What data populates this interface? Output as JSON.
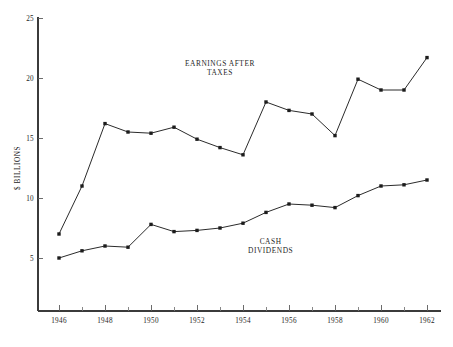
{
  "chart_data": {
    "type": "line",
    "title": "",
    "xlabel": "",
    "ylabel": "$ BILLIONS",
    "xlim": [
      1945.4,
      1962.6
    ],
    "ylim": [
      0,
      25
    ],
    "ytick_values": [
      5,
      10,
      15,
      20,
      25
    ],
    "ytick_labels": [
      "5",
      "10",
      "15",
      "20",
      "25"
    ],
    "x": [
      1946,
      1947,
      1948,
      1949,
      1950,
      1951,
      1952,
      1953,
      1954,
      1955,
      1956,
      1957,
      1958,
      1959,
      1960,
      1961,
      1962
    ],
    "xtick_values": [
      1946,
      1947,
      1948,
      1949,
      1950,
      1951,
      1952,
      1953,
      1954,
      1955,
      1956,
      1957,
      1958,
      1959,
      1960,
      1961,
      1962
    ],
    "xtick_labels": [
      "1946",
      "",
      "1948",
      "",
      "1950",
      "",
      "1952",
      "",
      "1954",
      "",
      "1956",
      "",
      "1958",
      "",
      "1960",
      "",
      "1962"
    ],
    "grid": false,
    "legend_position": "inline-annotation",
    "series": [
      {
        "name": "EARNINGS AFTER TAXES",
        "values": [
          7.0,
          11.0,
          16.2,
          15.5,
          15.4,
          15.9,
          14.9,
          14.2,
          13.6,
          18.0,
          17.3,
          17.0,
          15.2,
          19.9,
          19.0,
          19.0,
          21.7
        ],
        "annotation": "EARNINGS AFTER\nTAXES",
        "annotation_x": 1953.0,
        "annotation_y": 21.0
      },
      {
        "name": "CASH DIVIDENDS",
        "values": [
          5.0,
          5.6,
          6.0,
          5.9,
          7.8,
          7.2,
          7.3,
          7.5,
          7.9,
          8.8,
          9.5,
          9.4,
          9.2,
          10.2,
          11.0,
          11.1,
          11.5
        ],
        "annotation": "CASH\nDIVIDENDS",
        "annotation_x": 1955.2,
        "annotation_y": 6.2
      }
    ],
    "colors": {
      "line": "#2b2b2b",
      "marker": "#1c1c1c",
      "axis": "#3b3b3b",
      "text": "#222222",
      "background": "#ffffff"
    }
  },
  "annotations": {
    "earnings_line1": "EARNINGS AFTER",
    "earnings_line2": "TAXES",
    "dividends_line1": "CASH",
    "dividends_line2": "DIVIDENDS"
  },
  "axes": {
    "y_title": "$ BILLIONS"
  }
}
